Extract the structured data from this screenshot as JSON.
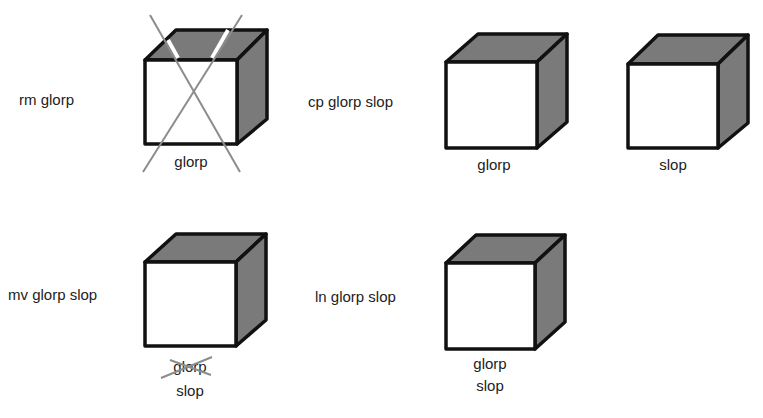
{
  "colors": {
    "background": "#ffffff",
    "cube_outline": "#111111",
    "cube_shade": "#7a7a7a",
    "cube_front": "#ffffff",
    "strike_line": "#8c8c8c",
    "text": "#222222"
  },
  "panels": [
    {
      "command": "rm glorp",
      "files": [
        {
          "label": "glorp",
          "deleted": true
        }
      ]
    },
    {
      "command": "cp glorp slop",
      "files": [
        {
          "label": "glorp",
          "deleted": false
        },
        {
          "label": "slop",
          "deleted": false
        }
      ]
    },
    {
      "command": "mv glorp slop",
      "files": [
        {
          "label_old": "glorp",
          "label_old_struck": true,
          "label_new": "slop"
        }
      ]
    },
    {
      "command": "ln glorp slop",
      "files": [
        {
          "label_1": "glorp",
          "label_2": "slop"
        }
      ]
    }
  ]
}
